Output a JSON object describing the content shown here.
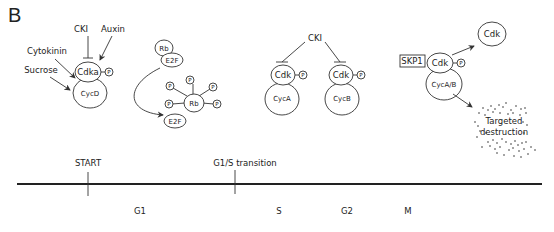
{
  "panel_label": "B",
  "g1_complex": {
    "inhibitor": "CKI",
    "activators": [
      "Auxin",
      "Cytokinin",
      "Sucrose"
    ],
    "kinase": "Cdka",
    "cyclin": "CycD",
    "phospho": "P"
  },
  "rb_pathway": {
    "complex_top": "Rb",
    "complex_bottom": "E2F",
    "phospho_rb": "Rb",
    "released": "E2F",
    "phospho": "P"
  },
  "s_g2_complexes": {
    "inhibitor": "CKI",
    "complex_a": {
      "kinase": "Cdk",
      "cyclin": "CycA",
      "phospho": "P"
    },
    "complex_b": {
      "kinase": "Cdk",
      "cyclin": "CycB",
      "phospho": "P"
    }
  },
  "m_complex": {
    "regulator": "SKP1",
    "kinase": "Cdk",
    "cyclin": "CycA/B",
    "phospho": "P",
    "free_kinase": "Cdk",
    "fate_line1": "Targeted",
    "fate_line2": "destruction"
  },
  "timeline": {
    "checkpoints": [
      {
        "label": "START"
      },
      {
        "label": "G1/S transition"
      }
    ],
    "phases": [
      "G1",
      "S",
      "G2",
      "M"
    ]
  }
}
